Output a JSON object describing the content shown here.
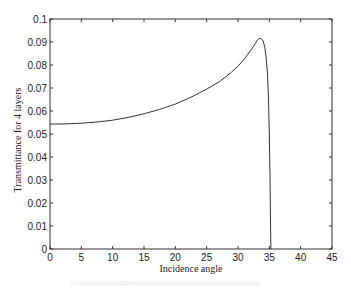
{
  "chart_data": {
    "type": "line",
    "title": "",
    "xlabel": "Incidence angle",
    "ylabel": "Transmittance for 4 layers",
    "xlim": [
      0,
      45
    ],
    "ylim": [
      0,
      0.1
    ],
    "xticks": [
      0,
      5,
      10,
      15,
      20,
      25,
      30,
      35,
      40,
      45
    ],
    "yticks": [
      0,
      0.01,
      0.02,
      0.03,
      0.04,
      0.05,
      0.06,
      0.07,
      0.08,
      0.09,
      0.1
    ],
    "xtick_labels": [
      "0",
      "5",
      "10",
      "15",
      "20",
      "25",
      "30",
      "35",
      "40",
      "45"
    ],
    "ytick_labels": [
      "0",
      "0.01",
      "0.02",
      "0.03",
      "0.04",
      "0.05",
      "0.06",
      "0.07",
      "0.08",
      "0.09",
      "0.1"
    ],
    "grid": false,
    "legend": null,
    "series": [
      {
        "name": "Transmittance",
        "color": "#333333",
        "x": [
          0,
          2.5,
          5,
          7.5,
          10,
          12.5,
          15,
          17.5,
          20,
          22.5,
          25,
          27,
          28,
          29,
          30,
          31,
          32,
          32.5,
          33,
          33.3,
          33.6,
          34,
          34.3,
          34.5,
          34.7,
          34.85,
          35.0,
          35.1,
          35.15,
          35.2,
          35.25
        ],
        "y": [
          0.0543,
          0.0544,
          0.0547,
          0.0552,
          0.056,
          0.0572,
          0.0588,
          0.0607,
          0.063,
          0.066,
          0.0695,
          0.0727,
          0.0748,
          0.077,
          0.0795,
          0.0826,
          0.0862,
          0.0882,
          0.0905,
          0.0915,
          0.0917,
          0.0905,
          0.0875,
          0.083,
          0.076,
          0.067,
          0.05,
          0.032,
          0.02,
          0.008,
          0.0
        ]
      }
    ]
  }
}
